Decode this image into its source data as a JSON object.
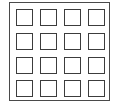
{
  "diagram": {
    "type": "grid",
    "rows": 4,
    "columns": 4,
    "colors": {
      "stroke": "#3c3c3c",
      "background": "#ffffff"
    },
    "cells": [
      {
        "row": 0,
        "col": 0
      },
      {
        "row": 0,
        "col": 1
      },
      {
        "row": 0,
        "col": 2
      },
      {
        "row": 0,
        "col": 3
      },
      {
        "row": 1,
        "col": 0
      },
      {
        "row": 1,
        "col": 1
      },
      {
        "row": 1,
        "col": 2
      },
      {
        "row": 1,
        "col": 3
      },
      {
        "row": 2,
        "col": 0
      },
      {
        "row": 2,
        "col": 1
      },
      {
        "row": 2,
        "col": 2
      },
      {
        "row": 2,
        "col": 3
      },
      {
        "row": 3,
        "col": 0
      },
      {
        "row": 3,
        "col": 1
      },
      {
        "row": 3,
        "col": 2
      },
      {
        "row": 3,
        "col": 3
      }
    ]
  }
}
